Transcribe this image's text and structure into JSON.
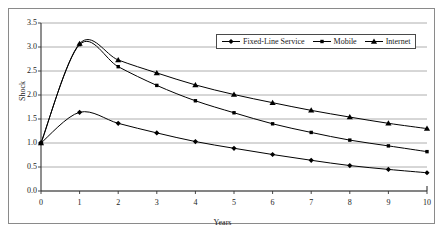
{
  "chart_data": {
    "type": "line",
    "title": "",
    "xlabel": "Years",
    "ylabel": "Shock",
    "xlim": [
      0,
      10
    ],
    "ylim": [
      0.0,
      3.5
    ],
    "grid": true,
    "legend_position": "top-right",
    "x": [
      0,
      1,
      2,
      3,
      4,
      5,
      6,
      7,
      8,
      9,
      10
    ],
    "xticks": [
      "0",
      "1",
      "2",
      "3",
      "4",
      "5",
      "6",
      "7",
      "8",
      "9",
      "10"
    ],
    "yticks": [
      "0.0",
      "0.5",
      "1.0",
      "1.5",
      "2.0",
      "2.5",
      "3.0",
      "3.5"
    ],
    "ytick_values": [
      0.0,
      0.5,
      1.0,
      1.5,
      2.0,
      2.5,
      3.0,
      3.5
    ],
    "series": [
      {
        "name": "Fixed-Line Service",
        "marker": "diamond",
        "color": "#000000",
        "values": [
          1.0,
          1.64,
          1.41,
          1.21,
          1.03,
          0.89,
          0.76,
          0.64,
          0.53,
          0.45,
          0.38
        ]
      },
      {
        "name": "Mobile",
        "marker": "square",
        "color": "#000000",
        "values": [
          1.0,
          3.05,
          2.59,
          2.2,
          1.88,
          1.63,
          1.4,
          1.22,
          1.06,
          0.94,
          0.82
        ]
      },
      {
        "name": "Internet",
        "marker": "triangle",
        "color": "#000000",
        "values": [
          1.0,
          3.07,
          2.73,
          2.46,
          2.21,
          2.01,
          1.84,
          1.68,
          1.54,
          1.41,
          1.3
        ]
      }
    ]
  }
}
